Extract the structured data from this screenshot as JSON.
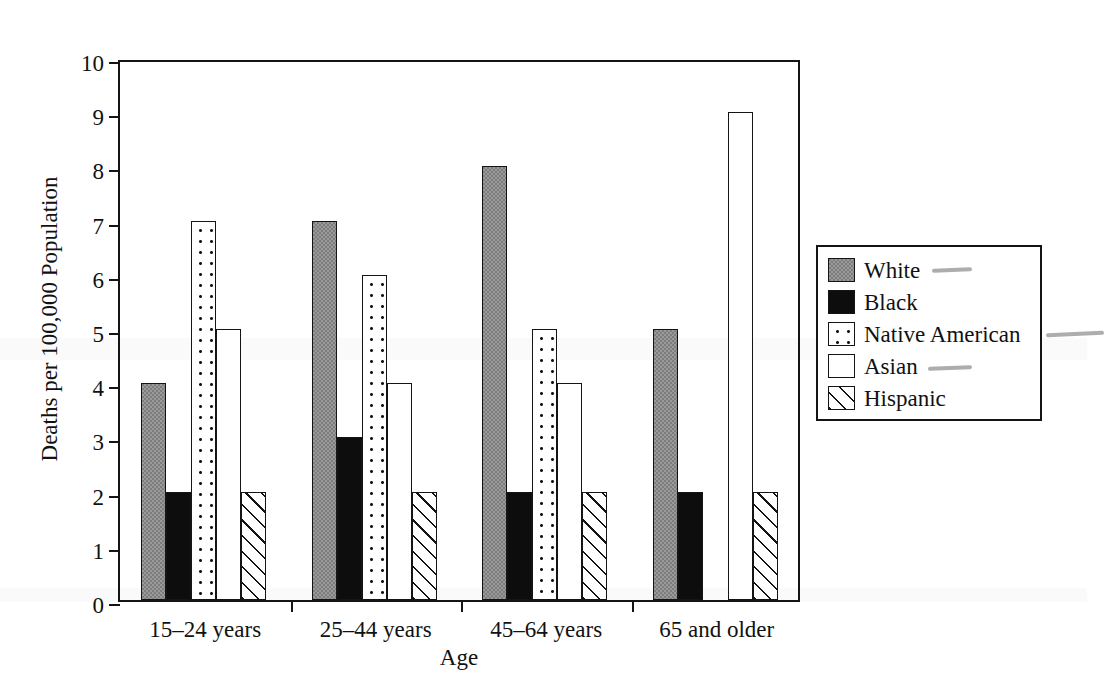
{
  "chart_data": {
    "type": "bar",
    "title": "",
    "xlabel": "Age",
    "ylabel": "Deaths per 100,000 Population",
    "ylim": [
      0,
      10
    ],
    "ytick_labels": [
      "0",
      "1",
      "2",
      "3",
      "4",
      "5",
      "6",
      "7",
      "8",
      "9",
      "10"
    ],
    "grid": false,
    "legend_position": "right",
    "categories": [
      "15–24 years",
      "25–44 years",
      "45–64 years",
      "65 and older"
    ],
    "series": [
      {
        "name": "White",
        "fill": "gray",
        "values": [
          4,
          7,
          8,
          5
        ]
      },
      {
        "name": "Black",
        "fill": "black",
        "values": [
          2,
          3,
          2,
          2
        ]
      },
      {
        "name": "Native American",
        "fill": "dots",
        "values": [
          7,
          6,
          5,
          0
        ]
      },
      {
        "name": "Asian",
        "fill": "white",
        "values": [
          5,
          4,
          4,
          9
        ]
      },
      {
        "name": "Hispanic",
        "fill": "hatch",
        "values": [
          2,
          2,
          2,
          2
        ]
      }
    ]
  },
  "legend": {
    "entries": [
      {
        "label": "White",
        "fill": "gray"
      },
      {
        "label": "Black",
        "fill": "black"
      },
      {
        "label": "Native American",
        "fill": "dots"
      },
      {
        "label": "Asian",
        "fill": "white"
      },
      {
        "label": "Hispanic",
        "fill": "hatch"
      }
    ]
  },
  "colors": {
    "axis": "#141414",
    "gray_fill": "#7d7d7d",
    "black_fill": "#0d0d0d",
    "white_fill": "#ffffff",
    "page_background": "#ffffff"
  }
}
